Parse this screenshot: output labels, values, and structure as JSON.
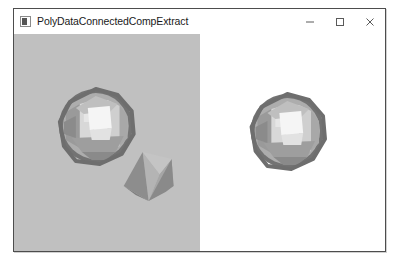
{
  "window": {
    "title": "PolyDataConnectedCompExtract",
    "icon": "application-icon",
    "controls": {
      "minimize_label": "–",
      "maximize_label": "□",
      "close_label": "✕"
    }
  },
  "render": {
    "left_viewport": {
      "name": "input-polydata-viewport",
      "background_color": "#c0c0c0",
      "objects": [
        "faceted-sphere",
        "faceted-cone"
      ]
    },
    "right_viewport": {
      "name": "extracted-component-viewport",
      "background_color": "#ffffff",
      "objects": [
        "faceted-sphere"
      ]
    }
  },
  "colors": {
    "frame_border": "#4d4d4d",
    "title_text": "#1a1a1a",
    "left_background": "#c0c0c0",
    "right_background": "#ffffff",
    "mesh_light": "#f2f2f2",
    "mesh_mid": "#c8c8c8",
    "mesh_dark": "#909090",
    "mesh_rim": "#6e6e6e"
  }
}
